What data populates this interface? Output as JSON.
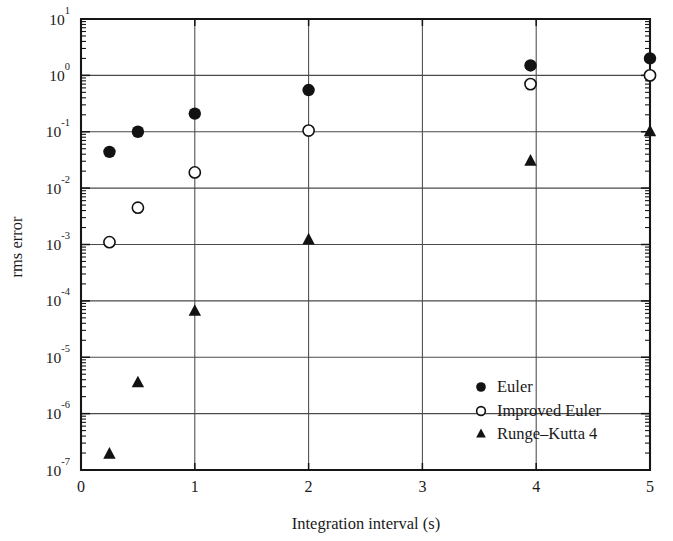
{
  "chart_data": {
    "type": "scatter",
    "title": "",
    "xlabel": "Integration interval (s)",
    "ylabel": "rms error",
    "xlim": [
      0,
      5
    ],
    "ylim": [
      1e-07,
      10
    ],
    "yscale": "log",
    "xscale": "linear",
    "grid": true,
    "legend_position": "lower right",
    "xticks": [
      "0",
      "1",
      "2",
      "3",
      "4",
      "5"
    ],
    "xtick_values": [
      0,
      1,
      2,
      3,
      4,
      5
    ],
    "ytick_labels": [
      "10",
      "10",
      "10",
      "10",
      "10",
      "10",
      "10",
      "10",
      "10"
    ],
    "ytick_exponents": [
      "1",
      "0",
      "-1",
      "-2",
      "-3",
      "-4",
      "-5",
      "-6",
      "-7"
    ],
    "ytick_values": [
      10,
      1,
      0.1,
      0.01,
      0.001,
      0.0001,
      1e-05,
      1e-06,
      1e-07
    ],
    "series": [
      {
        "name": "Euler",
        "marker": "filled-circle",
        "color": "#121212",
        "x": [
          0.25,
          0.5,
          1,
          2,
          3.95,
          5
        ],
        "y": [
          0.044,
          0.1,
          0.21,
          0.55,
          1.5,
          2.0
        ]
      },
      {
        "name": "Improved Euler",
        "marker": "open-circle",
        "color": "#121212",
        "x": [
          0.25,
          0.5,
          1,
          2,
          3.95,
          5
        ],
        "y": [
          0.0011,
          0.0045,
          0.019,
          0.105,
          0.7,
          1.0
        ]
      },
      {
        "name": "Runge–Kutta 4",
        "marker": "filled-triangle",
        "color": "#121212",
        "x": [
          0.25,
          0.5,
          1,
          2,
          3.95,
          5
        ],
        "y": [
          1.9e-07,
          3.5e-06,
          6.5e-05,
          0.0012,
          0.03,
          0.1
        ]
      }
    ]
  },
  "legend": {
    "entries": [
      {
        "label": "Euler",
        "marker": "filled-circle"
      },
      {
        "label": "Improved Euler",
        "marker": "open-circle"
      },
      {
        "label": "Runge–Kutta 4",
        "marker": "filled-triangle"
      }
    ]
  },
  "axes": {
    "x_title": "Integration interval (s)",
    "y_title": "rms error"
  }
}
